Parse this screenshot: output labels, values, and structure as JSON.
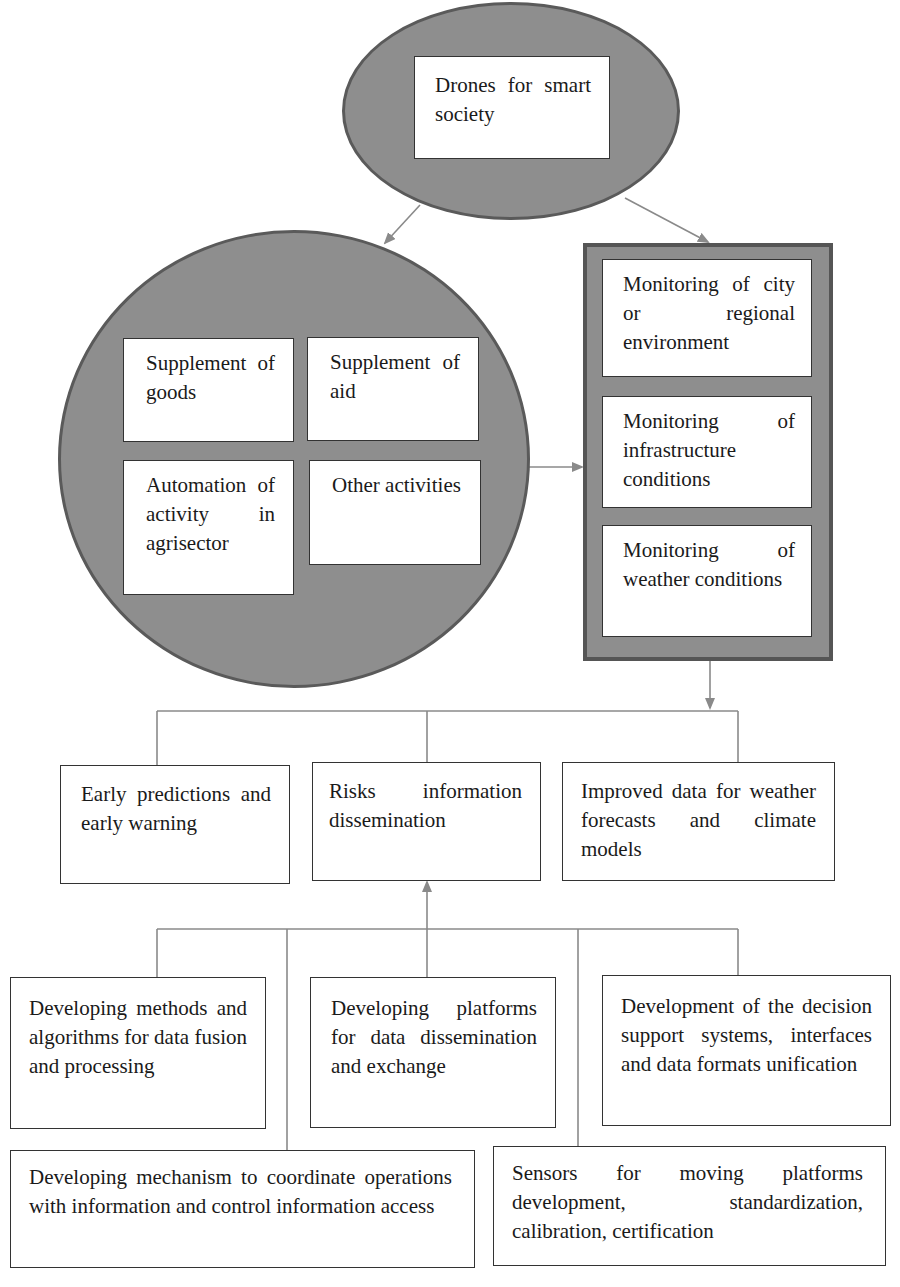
{
  "diagram": {
    "root": {
      "label": "Drones for smart society"
    },
    "applications": {
      "items": [
        {
          "label": "Supplement of goods"
        },
        {
          "label": "Supplement of aid"
        },
        {
          "label": "Automation of activity in agrisector"
        },
        {
          "label": "Other activities"
        }
      ]
    },
    "monitoring": {
      "items": [
        {
          "label": "Monitoring of city or regional environment"
        },
        {
          "label": "Monitoring of infrastructure conditions"
        },
        {
          "label": "Monitoring of weather conditions"
        }
      ]
    },
    "outcomes": {
      "items": [
        {
          "label": "Early predictions and early warning"
        },
        {
          "label": "Risks information dissemination"
        },
        {
          "label": "Improved data for weather forecasts and climate models"
        }
      ]
    },
    "developments": {
      "items": [
        {
          "label": "Developing methods and algorithms for data fusion and processing"
        },
        {
          "label": "Developing platforms for data dissemination and exchange"
        },
        {
          "label": "Development of the decision support systems, interfaces and data formats unification"
        },
        {
          "label": "Developing mechanism to coordinate operations with information and control information access"
        },
        {
          "label": "Sensors for moving platforms development, standardization, calibration, certification"
        }
      ]
    },
    "colors": {
      "shape_fill": "#8e8e8e",
      "shape_border": "#5a5a5a",
      "connector": "#8a8a8a",
      "box_border": "#333333"
    }
  }
}
